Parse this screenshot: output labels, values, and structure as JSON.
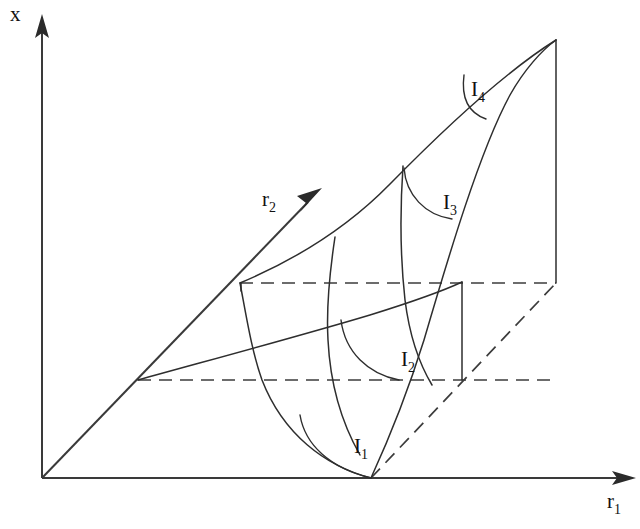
{
  "figure": {
    "kind": "3d-surface-sketch",
    "background_color": "#ffffff",
    "ink_color": "#2e2e2e",
    "axes": [
      {
        "id": "x",
        "name": "x-axis",
        "label": "x",
        "subscript": "",
        "label_x": 12,
        "label_y": 20,
        "from": [
          42,
          478
        ],
        "to": [
          42,
          18
        ],
        "arrow": "up"
      },
      {
        "id": "r1",
        "name": "r1-axis",
        "label": "r",
        "subscript": "1",
        "label_x": 607,
        "label_y": 510,
        "from": [
          42,
          478
        ],
        "to": [
          634,
          478
        ],
        "arrow": "right"
      },
      {
        "id": "r2",
        "name": "r2-axis",
        "label": "r",
        "subscript": "2",
        "label_x": 262,
        "label_y": 208,
        "from": [
          42,
          478
        ],
        "to": [
          320,
          190
        ],
        "arrow": "up-right"
      }
    ],
    "isolines": [
      {
        "id": "I1",
        "label": "I",
        "subscript": "1",
        "label_x": 355,
        "label_y": 454
      },
      {
        "id": "I2",
        "label": "I",
        "subscript": "2",
        "label_x": 401,
        "label_y": 367
      },
      {
        "id": "I3",
        "label": "I",
        "subscript": "3",
        "label_x": 443,
        "label_y": 211
      },
      {
        "id": "I4",
        "label": "I",
        "subscript": "4",
        "label_x": 471,
        "label_y": 98
      }
    ],
    "vertices": {
      "origin": [
        42,
        478
      ],
      "base_front": [
        371,
        478
      ],
      "peak": [
        556,
        40
      ],
      "r2_base_mid": [
        138,
        380
      ],
      "r2_base_upper": [
        240,
        283
      ],
      "right_lower": [
        556,
        283
      ],
      "mid_vertical_top": [
        462,
        282
      ],
      "mid_vertical_bottom": [
        462,
        380
      ]
    },
    "dashed_segments": [
      {
        "name": "lower-depth-line",
        "from": [
          138,
          380
        ],
        "to": [
          556,
          380
        ]
      },
      {
        "name": "upper-depth-line",
        "from": [
          240,
          283
        ],
        "to": [
          556,
          283
        ]
      },
      {
        "name": "diagonal-depth-line",
        "from": [
          371,
          478
        ],
        "to": [
          556,
          283
        ]
      }
    ],
    "curve_count": 4,
    "ruling_count": 4
  }
}
